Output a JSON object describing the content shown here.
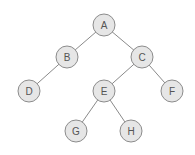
{
  "diagram": {
    "type": "binary-tree",
    "style": {
      "node_fill": "#e6e6e6",
      "node_stroke": "#8c8c8c",
      "edge_color": "#8a8a8a",
      "text_color": "#555555",
      "node_radius": 11
    },
    "nodes": [
      {
        "id": "A",
        "label": "A",
        "x": 104,
        "y": 25
      },
      {
        "id": "B",
        "label": "B",
        "x": 67,
        "y": 57
      },
      {
        "id": "C",
        "label": "C",
        "x": 142,
        "y": 57
      },
      {
        "id": "D",
        "label": "D",
        "x": 29,
        "y": 91
      },
      {
        "id": "E",
        "label": "E",
        "x": 104,
        "y": 91
      },
      {
        "id": "F",
        "label": "F",
        "x": 172,
        "y": 91
      },
      {
        "id": "G",
        "label": "G",
        "x": 76,
        "y": 131
      },
      {
        "id": "H",
        "label": "H",
        "x": 131,
        "y": 131
      }
    ],
    "edges": [
      {
        "from": "A",
        "to": "B"
      },
      {
        "from": "A",
        "to": "C"
      },
      {
        "from": "B",
        "to": "D"
      },
      {
        "from": "C",
        "to": "E"
      },
      {
        "from": "C",
        "to": "F"
      },
      {
        "from": "E",
        "to": "G"
      },
      {
        "from": "E",
        "to": "H"
      }
    ]
  }
}
